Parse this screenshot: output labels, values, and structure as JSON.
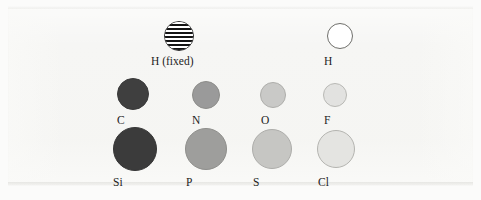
{
  "figure": {
    "kind": "element-sphere-legend",
    "background_color": "#f6f6f4",
    "label_color": "#1d1d1d"
  },
  "atoms": [
    {
      "id": "h-fixed",
      "label": "H (fixed)",
      "style": "striped",
      "fill": "#ffffff",
      "stripe_color": "#141414",
      "outline": "#2b2b2b",
      "diameter": 30,
      "x": 164,
      "y": 21,
      "label_x": 151,
      "label_y": 55,
      "row": 1,
      "column": 2
    },
    {
      "id": "h",
      "label": "H",
      "style": "solid",
      "fill": "#ffffff",
      "outline": "#6f6f6b",
      "diameter": 26,
      "x": 327,
      "y": 23,
      "label_x": 324,
      "label_y": 55,
      "row": 1,
      "column": 4
    },
    {
      "id": "c",
      "label": "C",
      "style": "solid",
      "fill": "#3f3f3f",
      "outline": "#3a3a3a",
      "diameter": 32,
      "x": 117,
      "y": 78,
      "label_x": 117,
      "label_y": 114,
      "row": 2,
      "column": 1
    },
    {
      "id": "n",
      "label": "N",
      "style": "solid",
      "fill": "#9a9a9a",
      "outline": "#8d8d8a",
      "diameter": 28,
      "x": 192,
      "y": 81,
      "label_x": 192,
      "label_y": 114,
      "row": 2,
      "column": 2
    },
    {
      "id": "o",
      "label": "O",
      "style": "solid",
      "fill": "#c9c9c7",
      "outline": "#aeaeab",
      "diameter": 26,
      "x": 260,
      "y": 82,
      "label_x": 261,
      "label_y": 114,
      "row": 2,
      "column": 3
    },
    {
      "id": "f",
      "label": "F",
      "style": "solid",
      "fill": "#e2e2e0",
      "outline": "#b9b9b5",
      "diameter": 24,
      "x": 323,
      "y": 83,
      "label_x": 324,
      "label_y": 114,
      "row": 2,
      "column": 4
    },
    {
      "id": "si",
      "label": "Si",
      "style": "solid",
      "fill": "#3b3b3b",
      "outline": "#363636",
      "diameter": 44,
      "x": 113,
      "y": 127,
      "label_x": 113,
      "label_y": 176,
      "row": 3,
      "column": 1
    },
    {
      "id": "p",
      "label": "P",
      "style": "solid",
      "fill": "#9e9e9c",
      "outline": "#8e8e8b",
      "diameter": 42,
      "x": 185,
      "y": 128,
      "label_x": 186,
      "label_y": 176,
      "row": 3,
      "column": 2
    },
    {
      "id": "s",
      "label": "S",
      "style": "solid",
      "fill": "#c6c6c3",
      "outline": "#adadaa",
      "diameter": 40,
      "x": 252,
      "y": 129,
      "label_x": 253,
      "label_y": 176,
      "row": 3,
      "column": 3
    },
    {
      "id": "cl",
      "label": "Cl",
      "style": "solid",
      "fill": "#e4e4e1",
      "outline": "#b4b4b0",
      "diameter": 38,
      "x": 317,
      "y": 130,
      "label_x": 318,
      "label_y": 176,
      "row": 3,
      "column": 4
    }
  ]
}
